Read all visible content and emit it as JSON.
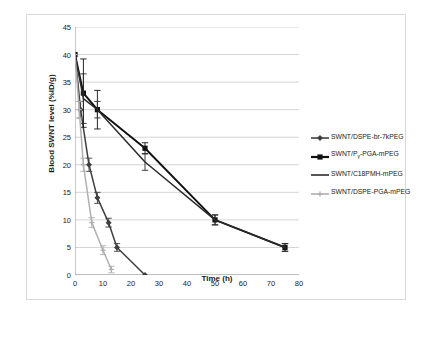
{
  "chart_data": {
    "type": "line",
    "title": "",
    "xlabel": "Time (h)",
    "ylabel": "Blood SWNT level (%ID/g)",
    "xlim": [
      0,
      80
    ],
    "ylim": [
      0,
      45
    ],
    "xticks": [
      "0",
      "10",
      "20",
      "30",
      "40",
      "50",
      "60",
      "70",
      "80"
    ],
    "yticks": [
      "0",
      "5",
      "10",
      "15",
      "20",
      "25",
      "30",
      "35",
      "40",
      "45"
    ],
    "grid": "horizontal",
    "legend_position": "right",
    "series": [
      {
        "name": "SWNT/DSPE-br-7kPEG",
        "marker": "diamond",
        "color": "#3f3f3f",
        "x": [
          0,
          2,
          5,
          8,
          12,
          15,
          25
        ],
        "values": [
          40,
          30,
          20,
          14,
          9.5,
          5,
          0
        ],
        "errors": [
          0,
          1.5,
          1.2,
          1.0,
          0.8,
          0.7,
          0
        ]
      },
      {
        "name": "SWNT/Pγ-PGA-mPEG",
        "marker": "square",
        "color": "#111111",
        "x": [
          0,
          3,
          8,
          25,
          50,
          75
        ],
        "values": [
          40,
          33,
          30,
          23,
          10,
          5
        ],
        "errors": [
          0,
          6.2,
          3.5,
          1.0,
          0.9,
          0.7
        ]
      },
      {
        "name": "SWNT/C18PMH-mPEG",
        "marker": "none",
        "color": "#2b2b2b",
        "x": [
          0,
          3,
          8,
          25,
          50,
          75
        ],
        "values": [
          40,
          32,
          30,
          20.5,
          10,
          5
        ],
        "errors": [
          0,
          4.5,
          1.5,
          1.5,
          0.9,
          0.7
        ]
      },
      {
        "name": "SWNT/DSPE-PGA-mPEG",
        "marker": "cross",
        "color": "#b0b0b0",
        "x": [
          0,
          1.5,
          3,
          6,
          10,
          13
        ],
        "values": [
          40,
          30,
          20,
          9.5,
          4.5,
          1
        ],
        "errors": [
          0,
          1.5,
          1.2,
          0.9,
          0.8,
          0.6
        ]
      }
    ]
  }
}
